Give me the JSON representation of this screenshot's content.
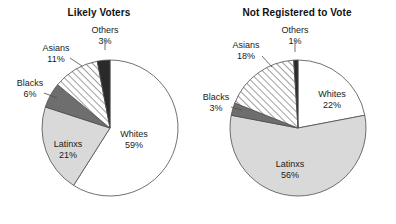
{
  "figure": {
    "background": "#ffffff",
    "width": 396,
    "height": 224
  },
  "palette": {
    "whites": "#ffffff",
    "latinxs": "#d9d9d9",
    "blacks": "#6e6e6e",
    "asians_hatch_bg": "#ffffff",
    "asians_hatch_line": "#4d4d4d",
    "others": "#2a2a2a",
    "outline": "#4d4d4d",
    "text": "#1a1a1a"
  },
  "chart_data": [
    {
      "type": "pie",
      "title": "Likely Voters",
      "panel": "left",
      "start_angle_deg": 0,
      "direction": "clockwise",
      "categories": [
        "Whites",
        "Latinxs",
        "Blacks",
        "Asians",
        "Others"
      ],
      "values": [
        59,
        21,
        6,
        11,
        3
      ],
      "unit": "%",
      "slices": [
        {
          "label": "Whites",
          "value": 59,
          "value_text": "59%",
          "fill": "#ffffff",
          "pattern": "solid",
          "label_placement": "inside"
        },
        {
          "label": "Latinxs",
          "value": 21,
          "value_text": "21%",
          "fill": "#d9d9d9",
          "pattern": "solid",
          "label_placement": "inside"
        },
        {
          "label": "Blacks",
          "value": 6,
          "value_text": "6%",
          "fill": "#6e6e6e",
          "pattern": "solid",
          "label_placement": "outside"
        },
        {
          "label": "Asians",
          "value": 11,
          "value_text": "11%",
          "fill": "#ffffff",
          "pattern": "hatch",
          "label_placement": "outside"
        },
        {
          "label": "Others",
          "value": 3,
          "value_text": "3%",
          "fill": "#2a2a2a",
          "pattern": "solid",
          "label_placement": "outside"
        }
      ]
    },
    {
      "type": "pie",
      "title": "Not Registered to Vote",
      "panel": "right",
      "start_angle_deg": 0,
      "direction": "clockwise",
      "categories": [
        "Whites",
        "Latinxs",
        "Blacks",
        "Asians",
        "Others"
      ],
      "values": [
        22,
        56,
        3,
        18,
        1
      ],
      "unit": "%",
      "slices": [
        {
          "label": "Whites",
          "value": 22,
          "value_text": "22%",
          "fill": "#ffffff",
          "pattern": "solid",
          "label_placement": "inside"
        },
        {
          "label": "Latinxs",
          "value": 56,
          "value_text": "56%",
          "fill": "#d9d9d9",
          "pattern": "solid",
          "label_placement": "inside"
        },
        {
          "label": "Blacks",
          "value": 3,
          "value_text": "3%",
          "fill": "#6e6e6e",
          "pattern": "solid",
          "label_placement": "outside"
        },
        {
          "label": "Asians",
          "value": 18,
          "value_text": "18%",
          "fill": "#ffffff",
          "pattern": "hatch",
          "label_placement": "outside"
        },
        {
          "label": "Others",
          "value": 1,
          "value_text": "1%",
          "fill": "#2a2a2a",
          "pattern": "solid",
          "label_placement": "outside"
        }
      ]
    }
  ],
  "geometry": {
    "left": {
      "cx": 110,
      "cy": 128,
      "r": 68
    },
    "right": {
      "cx": 100,
      "cy": 128,
      "r": 68
    }
  },
  "label_positions": {
    "left": {
      "Whites": {
        "x": 134,
        "y": 137,
        "anchor": "middle"
      },
      "Latinxs": {
        "x": 68,
        "y": 147,
        "anchor": "middle"
      },
      "Blacks": {
        "x": 30,
        "y": 86,
        "anchor": "middle",
        "leader": [
          [
            44,
            93
          ],
          [
            57,
            98
          ]
        ]
      },
      "Asians": {
        "x": 56,
        "y": 51,
        "anchor": "middle",
        "leader": [
          [
            70,
            58
          ],
          [
            82,
            66
          ]
        ]
      },
      "Others": {
        "x": 105,
        "y": 33,
        "anchor": "middle",
        "leader": [
          [
            105,
            40
          ],
          [
            105,
            50
          ]
        ]
      }
    },
    "right": {
      "Whites": {
        "x": 134,
        "y": 97,
        "anchor": "middle"
      },
      "Latinxs": {
        "x": 92,
        "y": 167,
        "anchor": "middle"
      },
      "Blacks": {
        "x": 18,
        "y": 100,
        "anchor": "middle",
        "leader": [
          [
            33,
            107
          ],
          [
            44,
            110
          ]
        ]
      },
      "Asians": {
        "x": 48,
        "y": 48,
        "anchor": "middle",
        "leader": [
          [
            64,
            56
          ],
          [
            74,
            67
          ]
        ]
      },
      "Others": {
        "x": 97,
        "y": 33,
        "anchor": "middle",
        "leader": [
          [
            97,
            40
          ],
          [
            97,
            52
          ]
        ]
      }
    }
  }
}
